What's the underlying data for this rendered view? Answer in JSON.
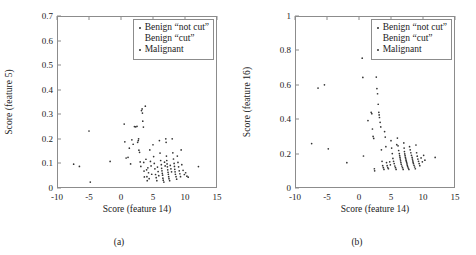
{
  "figure": {
    "panels": [
      {
        "subcaption": "(a)",
        "xlabel": "Score (feature 14)",
        "ylabel": "Score (feature 5)"
      },
      {
        "subcaption": "(b)",
        "xlabel": "Score (feature 14)",
        "ylabel": "Score (feature 16)"
      }
    ],
    "legend": {
      "entries": [
        {
          "label": "Benign “not cut”",
          "marker": "dot"
        },
        {
          "label": "Benign “cut”",
          "marker": "none"
        },
        {
          "label": "Malignant",
          "marker": "dot"
        }
      ]
    },
    "colors": {
      "point": "#333333",
      "axis": "#8c8c8c",
      "text": "#222222",
      "background": "#ffffff"
    }
  },
  "chart_data": [
    {
      "type": "scatter",
      "title": "",
      "subcaption": "(a)",
      "xlabel": "Score (feature 14)",
      "ylabel": "Score (feature 5)",
      "xlim": [
        -10,
        15
      ],
      "ylim": [
        0,
        0.7
      ],
      "xticks": [
        -10,
        -5,
        0,
        5,
        10,
        15
      ],
      "yticks": [
        0,
        0.1,
        0.2,
        0.3,
        0.4,
        0.5,
        0.6,
        0.7
      ],
      "grid": false,
      "legend_position": "top-right",
      "series": [
        {
          "name": "Benign “not cut” / Benign “cut” / Malignant",
          "points": [
            [
              -7.4,
              0.097
            ],
            [
              -6.5,
              0.088
            ],
            [
              -5.0,
              0.232
            ],
            [
              -4.8,
              0.024
            ],
            [
              -1.7,
              0.108
            ],
            [
              0.5,
              0.26
            ],
            [
              0.6,
              0.188
            ],
            [
              0.8,
              0.122
            ],
            [
              1.1,
              0.125
            ],
            [
              1.3,
              0.162
            ],
            [
              1.5,
              0.098
            ],
            [
              1.7,
              0.196
            ],
            [
              1.9,
              0.178
            ],
            [
              2.1,
              0.25
            ],
            [
              2.3,
              0.249
            ],
            [
              2.5,
              0.251
            ],
            [
              2.6,
              0.186
            ],
            [
              2.7,
              0.193
            ],
            [
              2.75,
              0.2
            ],
            [
              2.8,
              0.154
            ],
            [
              2.9,
              0.145
            ],
            [
              3.0,
              0.106
            ],
            [
              3.1,
              0.088
            ],
            [
              3.2,
              0.315
            ],
            [
              3.3,
              0.322
            ],
            [
              3.35,
              0.305
            ],
            [
              3.4,
              0.272
            ],
            [
              3.5,
              0.248
            ],
            [
              3.55,
              0.104
            ],
            [
              3.6,
              0.069
            ],
            [
              3.65,
              0.045
            ],
            [
              3.7,
              0.533
            ],
            [
              3.8,
              0.333
            ],
            [
              3.9,
              0.117
            ],
            [
              4.0,
              0.074
            ],
            [
              4.05,
              0.046
            ],
            [
              4.1,
              0.03
            ],
            [
              4.2,
              0.082
            ],
            [
              4.3,
              0.062
            ],
            [
              4.4,
              0.038
            ],
            [
              4.5,
              0.155
            ],
            [
              4.6,
              0.108
            ],
            [
              4.7,
              0.09
            ],
            [
              4.8,
              0.056
            ],
            [
              5.0,
              0.176
            ],
            [
              5.1,
              0.128
            ],
            [
              5.2,
              0.1
            ],
            [
              5.3,
              0.078
            ],
            [
              5.4,
              0.055
            ],
            [
              5.5,
              0.042
            ],
            [
              5.6,
              0.03
            ],
            [
              5.7,
              0.085
            ],
            [
              5.8,
              0.067
            ],
            [
              5.9,
              0.05
            ],
            [
              6.0,
              0.193
            ],
            [
              6.1,
              0.142
            ],
            [
              6.2,
              0.112
            ],
            [
              6.3,
              0.095
            ],
            [
              6.35,
              0.08
            ],
            [
              6.4,
              0.07
            ],
            [
              6.45,
              0.06
            ],
            [
              6.5,
              0.052
            ],
            [
              6.55,
              0.04
            ],
            [
              6.6,
              0.032
            ],
            [
              6.7,
              0.024
            ],
            [
              6.8,
              0.105
            ],
            [
              6.9,
              0.09
            ],
            [
              7.0,
              0.2
            ],
            [
              7.05,
              0.186
            ],
            [
              7.1,
              0.13
            ],
            [
              7.15,
              0.112
            ],
            [
              7.2,
              0.098
            ],
            [
              7.25,
              0.086
            ],
            [
              7.3,
              0.074
            ],
            [
              7.35,
              0.064
            ],
            [
              7.4,
              0.056
            ],
            [
              7.45,
              0.046
            ],
            [
              7.5,
              0.038
            ],
            [
              7.6,
              0.03
            ],
            [
              7.7,
              0.092
            ],
            [
              7.8,
              0.078
            ],
            [
              7.9,
              0.066
            ],
            [
              8.0,
              0.2
            ],
            [
              8.1,
              0.143
            ],
            [
              8.2,
              0.118
            ],
            [
              8.3,
              0.1
            ],
            [
              8.35,
              0.088
            ],
            [
              8.4,
              0.076
            ],
            [
              8.45,
              0.066
            ],
            [
              8.5,
              0.056
            ],
            [
              8.6,
              0.046
            ],
            [
              8.7,
              0.036
            ],
            [
              8.8,
              0.13
            ],
            [
              8.9,
              0.104
            ],
            [
              9.0,
              0.086
            ],
            [
              9.1,
              0.07
            ],
            [
              9.2,
              0.058
            ],
            [
              9.3,
              0.046
            ],
            [
              9.4,
              0.155
            ],
            [
              9.5,
              0.095
            ],
            [
              9.7,
              0.072
            ],
            [
              9.9,
              0.055
            ],
            [
              10.1,
              0.062
            ],
            [
              10.3,
              0.048
            ],
            [
              10.5,
              0.044
            ],
            [
              12.1,
              0.087
            ]
          ]
        }
      ]
    },
    {
      "type": "scatter",
      "title": "",
      "subcaption": "(b)",
      "xlabel": "Score (feature 14)",
      "ylabel": "Score (feature 16)",
      "xlim": [
        -10,
        15
      ],
      "ylim": [
        0,
        1
      ],
      "xticks": [
        -10,
        -5,
        0,
        5,
        10,
        15
      ],
      "yticks": [
        0,
        0.2,
        0.4,
        0.6,
        0.8,
        1
      ],
      "grid": false,
      "legend_position": "top-right",
      "series": [
        {
          "name": "Benign “not cut” / Benign “cut” / Malignant",
          "points": [
            [
              -7.4,
              0.258
            ],
            [
              -6.4,
              0.581
            ],
            [
              -5.4,
              0.6
            ],
            [
              -4.8,
              0.228
            ],
            [
              -1.9,
              0.147
            ],
            [
              0.5,
              0.755
            ],
            [
              0.6,
              0.643
            ],
            [
              0.7,
              0.186
            ],
            [
              1.4,
              0.392
            ],
            [
              1.9,
              0.44
            ],
            [
              2.0,
              0.432
            ],
            [
              2.1,
              0.343
            ],
            [
              2.2,
              0.3
            ],
            [
              2.3,
              0.288
            ],
            [
              2.4,
              0.112
            ],
            [
              2.45,
              0.1
            ],
            [
              2.6,
              0.755
            ],
            [
              2.7,
              0.645
            ],
            [
              2.8,
              0.578
            ],
            [
              2.9,
              0.548
            ],
            [
              3.0,
              0.487
            ],
            [
              3.1,
              0.44
            ],
            [
              3.15,
              0.425
            ],
            [
              3.2,
              0.41
            ],
            [
              3.3,
              0.382
            ],
            [
              3.4,
              0.355
            ],
            [
              3.5,
              0.222
            ],
            [
              3.6,
              0.155
            ],
            [
              3.7,
              0.13
            ],
            [
              3.8,
              0.118
            ],
            [
              3.9,
              0.108
            ],
            [
              4.0,
              0.328
            ],
            [
              4.1,
              0.296
            ],
            [
              4.2,
              0.24
            ],
            [
              4.3,
              0.148
            ],
            [
              4.4,
              0.13
            ],
            [
              4.5,
              0.118
            ],
            [
              4.6,
              0.112
            ],
            [
              4.8,
              0.152
            ],
            [
              4.9,
              0.135
            ],
            [
              5.0,
              0.275
            ],
            [
              5.1,
              0.232
            ],
            [
              5.2,
              0.2
            ],
            [
              5.3,
              0.172
            ],
            [
              5.4,
              0.155
            ],
            [
              5.5,
              0.142
            ],
            [
              5.6,
              0.128
            ],
            [
              5.7,
              0.118
            ],
            [
              5.8,
              0.108
            ],
            [
              5.9,
              0.252
            ],
            [
              6.0,
              0.29
            ],
            [
              6.1,
              0.245
            ],
            [
              6.2,
              0.218
            ],
            [
              6.3,
              0.2
            ],
            [
              6.35,
              0.188
            ],
            [
              6.4,
              0.178
            ],
            [
              6.45,
              0.168
            ],
            [
              6.5,
              0.158
            ],
            [
              6.55,
              0.148
            ],
            [
              6.6,
              0.138
            ],
            [
              6.7,
              0.128
            ],
            [
              6.8,
              0.118
            ],
            [
              6.9,
              0.108
            ],
            [
              7.0,
              0.262
            ],
            [
              7.05,
              0.232
            ],
            [
              7.1,
              0.212
            ],
            [
              7.15,
              0.198
            ],
            [
              7.2,
              0.188
            ],
            [
              7.25,
              0.178
            ],
            [
              7.3,
              0.17
            ],
            [
              7.35,
              0.162
            ],
            [
              7.4,
              0.155
            ],
            [
              7.45,
              0.148
            ],
            [
              7.5,
              0.14
            ],
            [
              7.55,
              0.132
            ],
            [
              7.6,
              0.124
            ],
            [
              7.7,
              0.116
            ],
            [
              7.8,
              0.108
            ],
            [
              7.9,
              0.24
            ],
            [
              8.0,
              0.222
            ],
            [
              8.1,
              0.205
            ],
            [
              8.2,
              0.19
            ],
            [
              8.3,
              0.178
            ],
            [
              8.35,
              0.168
            ],
            [
              8.4,
              0.158
            ],
            [
              8.45,
              0.15
            ],
            [
              8.5,
              0.142
            ],
            [
              8.6,
              0.132
            ],
            [
              8.7,
              0.122
            ],
            [
              8.8,
              0.112
            ],
            [
              8.9,
              0.25
            ],
            [
              9.0,
              0.205
            ],
            [
              9.1,
              0.185
            ],
            [
              9.2,
              0.168
            ],
            [
              9.3,
              0.155
            ],
            [
              9.4,
              0.142
            ],
            [
              9.5,
              0.13
            ],
            [
              9.7,
              0.175
            ],
            [
              9.9,
              0.152
            ],
            [
              10.1,
              0.19
            ],
            [
              10.3,
              0.162
            ],
            [
              11.9,
              0.178
            ]
          ]
        }
      ]
    }
  ]
}
